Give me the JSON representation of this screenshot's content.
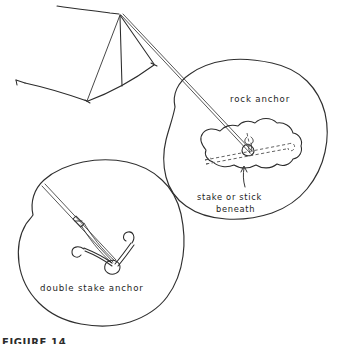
{
  "figure": {
    "domain_kind": "line-drawing-illustration",
    "background_color": "#ffffff",
    "ink_color": "#2b2b2b",
    "dashed_ink_color": "#5a5a5a",
    "width": 342,
    "height": 340,
    "figure_number": "FIGURE 14"
  },
  "labels": {
    "rock_anchor": "rock anchor",
    "stake_or_stick_line1": "stake or stick",
    "stake_or_stick_line2": "beneath",
    "double_stake_anchor": "double stake anchor"
  },
  "scene": {
    "tent": {
      "name": "a-frame tent",
      "peak_x": 119,
      "peak_y": 14,
      "guy_lines": 4,
      "stakes_visible": 3
    },
    "detail_callouts": [
      {
        "name": "rock-anchor-detail",
        "label": "rock anchor",
        "shape": "irregular blob",
        "center_x": 250,
        "center_y": 145,
        "contains": [
          "guy line",
          "rock",
          "dashed stake beneath",
          "loop knot"
        ]
      },
      {
        "name": "double-stake-anchor-detail",
        "label": "double stake anchor",
        "shape": "irregular blob",
        "center_x": 103,
        "center_y": 250,
        "contains": [
          "guy line",
          "two hooked stakes",
          "loop knot"
        ]
      }
    ]
  }
}
